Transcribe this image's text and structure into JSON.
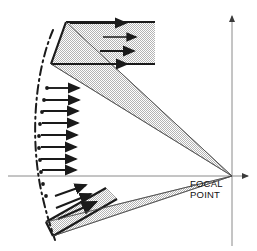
{
  "figure": {
    "type": "optics-ray-diagram",
    "background_color": "#ffffff",
    "line_color": "#1a1a1a",
    "axis_color": "#8a8a8a",
    "beam_fill_color": "#d9d9d9",
    "beam_edge_color": "#9a9a9a",
    "width": 257,
    "height": 251
  },
  "labels": {
    "focal_point_line1": "FOCAL",
    "focal_point_line2": "POINT"
  },
  "axes": {
    "horizontal": {
      "name": "optical-axis",
      "x_start": 8,
      "x_end": 252,
      "y": 176,
      "arrow_at": "right"
    },
    "vertical": {
      "name": "aperture-axis",
      "x": 232,
      "y_start": 12,
      "y_end": 246,
      "arrow_at": "top"
    }
  },
  "focal_point": {
    "x": 232,
    "y": 176,
    "label_x": 190,
    "label_y_line1": 186,
    "label_y_line2": 197
  },
  "mirror": {
    "name": "parabolic-mirror-arc",
    "style": "dash-dot",
    "path": "M 53,30 C 36,70 30,130 40,185 C 45,210 50,225 55,240",
    "dash_pattern": "9,4,2,4"
  },
  "beams": [
    {
      "name": "upper-incident-beam",
      "kind": "incoming-parallel",
      "polygon": "66,22 155,22 155,64 51,64",
      "arrows": [
        {
          "x1": 70,
          "y1": 23,
          "x2": 128,
          "y2": 23
        },
        {
          "x1": 103,
          "y1": 37,
          "x2": 138,
          "y2": 37
        },
        {
          "x1": 100,
          "y1": 51,
          "x2": 136,
          "y2": 51
        },
        {
          "x1": 68,
          "y1": 64,
          "x2": 129,
          "y2": 64
        }
      ]
    },
    {
      "name": "upper-reflected-wedge",
      "kind": "converging-to-focus",
      "polygon": "66,22 232,176 51,64"
    },
    {
      "name": "lower-reflected-wedge",
      "kind": "converging-to-focus",
      "polygon": "46,222 232,176 53,236"
    },
    {
      "name": "lower-incident-beam",
      "kind": "incoming-tilted",
      "polygon": "46,222 106,188 117,199 53,236"
    }
  ],
  "ray_arrows": {
    "name": "incident-ray-arrows",
    "middle_horizontal": [
      {
        "x1": 47,
        "y1": 88,
        "x2": 82,
        "y2": 88
      },
      {
        "x1": 45,
        "y1": 100,
        "x2": 82,
        "y2": 100
      },
      {
        "x1": 43,
        "y1": 111,
        "x2": 81,
        "y2": 111
      },
      {
        "x1": 42,
        "y1": 123,
        "x2": 81,
        "y2": 123
      },
      {
        "x1": 41,
        "y1": 135,
        "x2": 80,
        "y2": 135
      },
      {
        "x1": 41,
        "y1": 147,
        "x2": 79,
        "y2": 147
      },
      {
        "x1": 41,
        "y1": 159,
        "x2": 79,
        "y2": 159
      },
      {
        "x1": 42,
        "y1": 170,
        "x2": 79,
        "y2": 170
      }
    ],
    "lower_tilted": [
      {
        "x1": 55,
        "y1": 196,
        "x2": 88,
        "y2": 184
      },
      {
        "x1": 56,
        "y1": 208,
        "x2": 93,
        "y2": 193
      },
      {
        "x1": 58,
        "y1": 219,
        "x2": 98,
        "y2": 201
      }
    ]
  },
  "mirror_dots": {
    "name": "mirror-vertex-dots",
    "points": [
      {
        "x": 47,
        "y": 88
      },
      {
        "x": 44,
        "y": 100
      },
      {
        "x": 42,
        "y": 112
      },
      {
        "x": 40,
        "y": 124
      },
      {
        "x": 39,
        "y": 136
      },
      {
        "x": 39,
        "y": 148
      },
      {
        "x": 40,
        "y": 160
      },
      {
        "x": 41,
        "y": 172
      },
      {
        "x": 43,
        "y": 184
      },
      {
        "x": 46,
        "y": 196
      }
    ]
  }
}
